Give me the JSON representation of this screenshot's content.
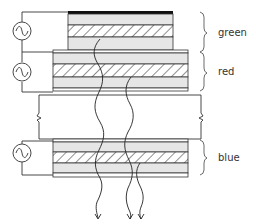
{
  "diagram": {
    "type": "stacked multicolor electroluminescent device cross-section",
    "colors": {
      "line": "#222222",
      "electrode": "#111111",
      "light_layer": "#e6e6e6",
      "hatched_layer": "#ffffff",
      "background": "#ffffff"
    },
    "layers": [
      {
        "id": "green",
        "label": "green"
      },
      {
        "id": "red",
        "label": "red"
      },
      {
        "id": "substrate",
        "label": ""
      },
      {
        "id": "blue",
        "label": "blue"
      }
    ],
    "labels": {
      "green": "green",
      "red": "red",
      "blue": "blue"
    },
    "ac_sources": [
      {
        "id": "source-green",
        "symbol": "~"
      },
      {
        "id": "source-red",
        "symbol": "~"
      },
      {
        "id": "source-blue",
        "symbol": "~"
      }
    ],
    "emitted_light_arrows": 3
  }
}
